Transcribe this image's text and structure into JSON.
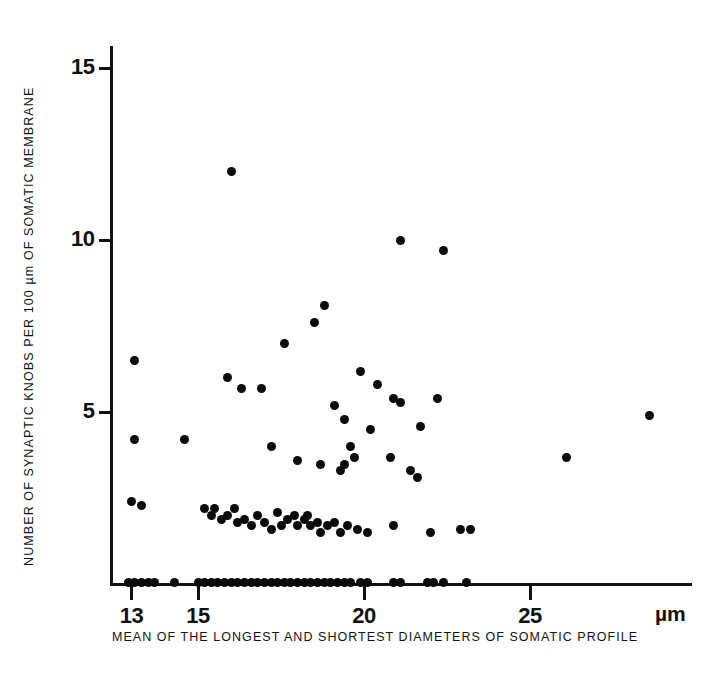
{
  "figure": {
    "background": "#ffffff",
    "marker_color": "#0a0a0a",
    "axis_color": "#111111"
  },
  "axes": {
    "y_title": "NUMBER OF SYNAPTIC KNOBS PER 100 µm OF SOMATIC MEMBRANE",
    "x_title": "MEAN OF THE LONGEST AND SHORTEST DIAMETERS OF SOMATIC PROFILE",
    "unit_label": "µm",
    "y_ticks": [
      5,
      10,
      15
    ],
    "x_ticks": [
      13,
      15,
      20,
      25
    ]
  },
  "chart_data": {
    "type": "scatter",
    "title": "",
    "xlabel": "MEAN OF THE LONGEST AND SHORTEST DIAMETERS OF SOMATIC PROFILE",
    "ylabel": "NUMBER OF SYNAPTIC KNOBS PER 100 µm OF SOMATIC MEMBRANE",
    "xunit": "µm",
    "xlim": [
      11.8,
      29.9
    ],
    "ylim": [
      0,
      15.7
    ],
    "xticks": [
      13,
      15,
      20,
      25
    ],
    "yticks": [
      5,
      10,
      15
    ],
    "grid": false,
    "legend": null,
    "series": [
      {
        "name": "synaptic knob density vs somatic profile diameter",
        "marker": "filled-circle",
        "points": [
          [
            16.0,
            12.0
          ],
          [
            21.1,
            10.0
          ],
          [
            22.4,
            9.7
          ],
          [
            18.8,
            8.1
          ],
          [
            18.5,
            7.6
          ],
          [
            17.6,
            7.0
          ],
          [
            13.1,
            6.5
          ],
          [
            15.9,
            6.0
          ],
          [
            16.3,
            5.7
          ],
          [
            16.9,
            5.7
          ],
          [
            22.2,
            5.4
          ],
          [
            19.9,
            6.2
          ],
          [
            20.4,
            5.8
          ],
          [
            20.9,
            5.4
          ],
          [
            21.1,
            5.3
          ],
          [
            19.1,
            5.2
          ],
          [
            19.4,
            4.8
          ],
          [
            20.2,
            4.5
          ],
          [
            21.7,
            4.6
          ],
          [
            13.1,
            4.2
          ],
          [
            14.6,
            4.2
          ],
          [
            17.2,
            4.0
          ],
          [
            19.6,
            4.0
          ],
          [
            19.7,
            3.7
          ],
          [
            19.4,
            3.5
          ],
          [
            19.3,
            3.3
          ],
          [
            18.0,
            3.6
          ],
          [
            18.7,
            3.5
          ],
          [
            20.8,
            3.7
          ],
          [
            21.4,
            3.3
          ],
          [
            21.6,
            3.1
          ],
          [
            26.1,
            3.7
          ],
          [
            28.6,
            4.9
          ],
          [
            13.0,
            2.4
          ],
          [
            13.3,
            2.3
          ],
          [
            15.2,
            2.2
          ],
          [
            15.4,
            2.0
          ],
          [
            15.5,
            2.2
          ],
          [
            15.7,
            1.9
          ],
          [
            15.9,
            2.0
          ],
          [
            16.1,
            2.2
          ],
          [
            16.2,
            1.8
          ],
          [
            16.4,
            1.9
          ],
          [
            16.6,
            1.7
          ],
          [
            16.8,
            2.0
          ],
          [
            17.0,
            1.8
          ],
          [
            17.2,
            1.6
          ],
          [
            17.4,
            2.1
          ],
          [
            17.5,
            1.7
          ],
          [
            17.7,
            1.9
          ],
          [
            17.9,
            2.0
          ],
          [
            18.0,
            1.7
          ],
          [
            18.2,
            1.9
          ],
          [
            18.3,
            2.0
          ],
          [
            18.4,
            1.7
          ],
          [
            18.6,
            1.8
          ],
          [
            18.7,
            1.5
          ],
          [
            18.9,
            1.7
          ],
          [
            19.1,
            1.8
          ],
          [
            19.3,
            1.5
          ],
          [
            19.5,
            1.7
          ],
          [
            19.8,
            1.6
          ],
          [
            20.1,
            1.5
          ],
          [
            20.9,
            1.7
          ],
          [
            22.0,
            1.5
          ],
          [
            22.9,
            1.6
          ],
          [
            23.2,
            1.6
          ],
          [
            12.9,
            0.05
          ],
          [
            13.1,
            0.05
          ],
          [
            13.3,
            0.05
          ],
          [
            13.5,
            0.05
          ],
          [
            13.7,
            0.05
          ],
          [
            14.3,
            0.05
          ],
          [
            15.0,
            0.05
          ],
          [
            15.2,
            0.05
          ],
          [
            15.4,
            0.05
          ],
          [
            15.6,
            0.05
          ],
          [
            15.8,
            0.05
          ],
          [
            16.0,
            0.05
          ],
          [
            16.2,
            0.05
          ],
          [
            16.4,
            0.05
          ],
          [
            16.6,
            0.05
          ],
          [
            16.8,
            0.05
          ],
          [
            17.0,
            0.05
          ],
          [
            17.2,
            0.05
          ],
          [
            17.4,
            0.05
          ],
          [
            17.6,
            0.05
          ],
          [
            17.8,
            0.05
          ],
          [
            18.0,
            0.05
          ],
          [
            18.2,
            0.05
          ],
          [
            18.4,
            0.05
          ],
          [
            18.6,
            0.05
          ],
          [
            18.8,
            0.05
          ],
          [
            19.0,
            0.05
          ],
          [
            19.2,
            0.05
          ],
          [
            19.4,
            0.05
          ],
          [
            19.6,
            0.05
          ],
          [
            19.9,
            0.05
          ],
          [
            20.1,
            0.05
          ],
          [
            20.9,
            0.05
          ],
          [
            21.1,
            0.05
          ],
          [
            21.9,
            0.05
          ],
          [
            22.1,
            0.05
          ],
          [
            22.4,
            0.05
          ],
          [
            23.1,
            0.05
          ]
        ]
      }
    ]
  }
}
